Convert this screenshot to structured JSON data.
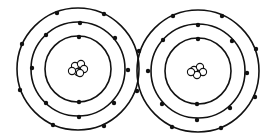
{
  "diagram": {
    "title": "",
    "type": "bohr-model-covalent-bond",
    "colors": {
      "background": "#ffffff",
      "line": "#111111",
      "electron": "#111111",
      "nucleon_fill": "#ffffff"
    },
    "atoms": [
      {
        "name": "left-atom",
        "center": [
          78,
          69
        ],
        "shell_radii": [
          33,
          47,
          61
        ],
        "electrons_per_shell": [
          2,
          8,
          8
        ],
        "electrons": [
          [
            79,
            37
          ],
          [
            79,
            102
          ],
          [
            80,
            23
          ],
          [
            115,
            38
          ],
          [
            128,
            70
          ],
          [
            114,
            103
          ],
          [
            79,
            117
          ],
          [
            46,
            103
          ],
          [
            32,
            68
          ],
          [
            46,
            35
          ],
          [
            57,
            13
          ],
          [
            104,
            14
          ],
          [
            139,
            51
          ],
          [
            137,
            91
          ],
          [
            104,
            126
          ],
          [
            53,
            125
          ],
          [
            20,
            90
          ],
          [
            22,
            44
          ]
        ],
        "nucleus": [
          [
            75,
            66
          ],
          [
            81,
            64
          ],
          [
            84,
            69
          ],
          [
            78,
            72
          ],
          [
            72,
            71
          ],
          [
            80,
            73
          ]
        ]
      },
      {
        "name": "right-atom",
        "center": [
          198,
          71
        ],
        "shell_radii": [
          33,
          47,
          61
        ],
        "electrons_per_shell": [
          2,
          8,
          8
        ],
        "electrons": [
          [
            198,
            39
          ],
          [
            197,
            104
          ],
          [
            198,
            25
          ],
          [
            232,
            41
          ],
          [
            247,
            73
          ],
          [
            230,
            108
          ],
          [
            197,
            120
          ],
          [
            162,
            104
          ],
          [
            148,
            71
          ],
          [
            163,
            40
          ],
          [
            173,
            16
          ],
          [
            222,
            16
          ],
          [
            256,
            49
          ],
          [
            255,
            97
          ],
          [
            221,
            128
          ],
          [
            172,
            127
          ]
        ],
        "nucleus": [
          [
            194,
            70
          ],
          [
            200,
            67
          ],
          [
            203,
            72
          ],
          [
            197,
            75
          ],
          [
            191,
            72
          ]
        ]
      }
    ],
    "shared_electrons_note": "two electrons at outer-ring intersection points are shared"
  }
}
